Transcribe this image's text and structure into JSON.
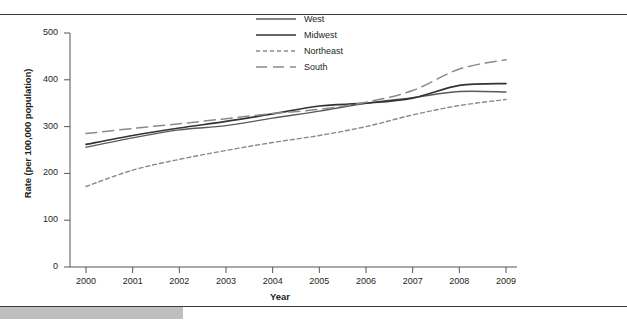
{
  "figure": {
    "name": "regional-rate-line-chart"
  },
  "chart_data": {
    "type": "line",
    "title": "",
    "subtitle": "",
    "xlabel": "Year",
    "ylabel": "Rate (per 100,000 population)",
    "x": [
      2000,
      2001,
      2002,
      2003,
      2004,
      2005,
      2006,
      2007,
      2008,
      2009
    ],
    "xtick_labels": [
      "2000",
      "2001",
      "2002",
      "2003",
      "2004",
      "2005",
      "2006",
      "2007",
      "2008",
      "2009"
    ],
    "ytick_labels": [
      "0",
      "100",
      "200",
      "300",
      "400",
      "500"
    ],
    "ytick_values": [
      0,
      100,
      200,
      300,
      400,
      500
    ],
    "xlim": [
      2000,
      2009
    ],
    "ylim": [
      0,
      500
    ],
    "grid": false,
    "legend_position": "top-center",
    "series": [
      {
        "name": "West",
        "style": "solid",
        "color": "#5a5a5a",
        "width": 1.4,
        "values": [
          256,
          276,
          293,
          302,
          318,
          333,
          350,
          362,
          375,
          374
        ]
      },
      {
        "name": "Midwest",
        "style": "solid",
        "color": "#333333",
        "width": 1.7,
        "values": [
          262,
          281,
          297,
          311,
          327,
          344,
          350,
          361,
          388,
          392
        ]
      },
      {
        "name": "Northeast",
        "style": "short-dash",
        "color": "#8a8a8a",
        "width": 1.4,
        "values": [
          172,
          207,
          230,
          249,
          266,
          281,
          300,
          325,
          345,
          358
        ]
      },
      {
        "name": "South",
        "style": "long-dash",
        "color": "#8a8a8a",
        "width": 1.5,
        "values": [
          285,
          296,
          306,
          317,
          328,
          337,
          352,
          377,
          423,
          443
        ]
      }
    ]
  },
  "legend": {
    "items": [
      {
        "label": "West"
      },
      {
        "label": "Midwest"
      },
      {
        "label": "Northeast"
      },
      {
        "label": "South"
      }
    ]
  }
}
